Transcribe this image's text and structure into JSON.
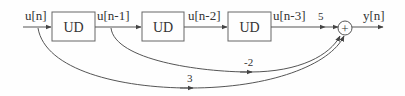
{
  "diagram": {
    "type": "block-diagram",
    "input_label": "u[n]",
    "output_label": "y[n]",
    "blocks": [
      {
        "id": "ud1",
        "label": "UD"
      },
      {
        "id": "ud2",
        "label": "UD"
      },
      {
        "id": "ud3",
        "label": "UD"
      }
    ],
    "signals": {
      "s1": "u[n-1]",
      "s2": "u[n-2]",
      "s3": "u[n-3]"
    },
    "gains": {
      "direct_u_n3": "5",
      "feedforward_u_n1": "-2",
      "feedforward_u_n": "3"
    },
    "summer_symbol": "+",
    "colors": {
      "stroke": "#555555",
      "text": "#333333",
      "background": "#fefefe"
    }
  }
}
